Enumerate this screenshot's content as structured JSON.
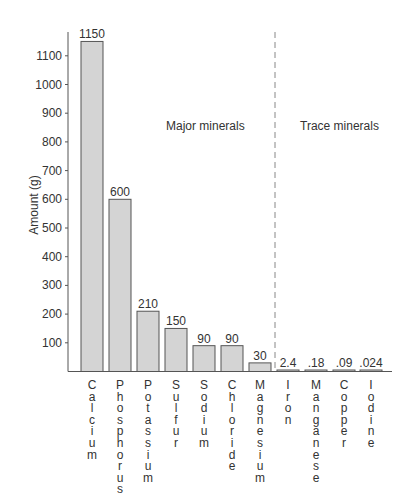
{
  "chart_data": {
    "type": "bar",
    "title": "",
    "xlabel": "",
    "ylabel": "Amount (g)",
    "ylim": [
      0,
      1150
    ],
    "yticks": [
      100,
      200,
      300,
      400,
      500,
      600,
      700,
      800,
      900,
      1000,
      1100
    ],
    "grid": false,
    "categories": [
      "Calcium",
      "Phosphorus",
      "Potassium",
      "Sulfur",
      "Sodium",
      "Chloride",
      "Magnesium",
      "Iron",
      "Manganese",
      "Copper",
      "Iodine"
    ],
    "values": [
      1150,
      600,
      210,
      150,
      90,
      90,
      30,
      2.4,
      0.18,
      0.09,
      0.024
    ],
    "value_labels": [
      "1150",
      "600",
      "210",
      "150",
      "90",
      "90",
      "30",
      "2.4",
      ".18",
      ".09",
      ".024"
    ],
    "groups": [
      {
        "name": "Major minerals",
        "categories": [
          "Calcium",
          "Phosphorus",
          "Potassium",
          "Sulfur",
          "Sodium",
          "Chloride",
          "Magnesium"
        ]
      },
      {
        "name": "Trace minerals",
        "categories": [
          "Iron",
          "Manganese",
          "Copper",
          "Iodine"
        ]
      }
    ],
    "annotations": [
      "Major minerals",
      "Trace minerals"
    ],
    "bar_color": "#d4d4d4",
    "bar_edge_color": "#555555"
  },
  "labels": {
    "ylabel": "Amount (g)",
    "major": "Major minerals",
    "trace": "Trace minerals"
  }
}
